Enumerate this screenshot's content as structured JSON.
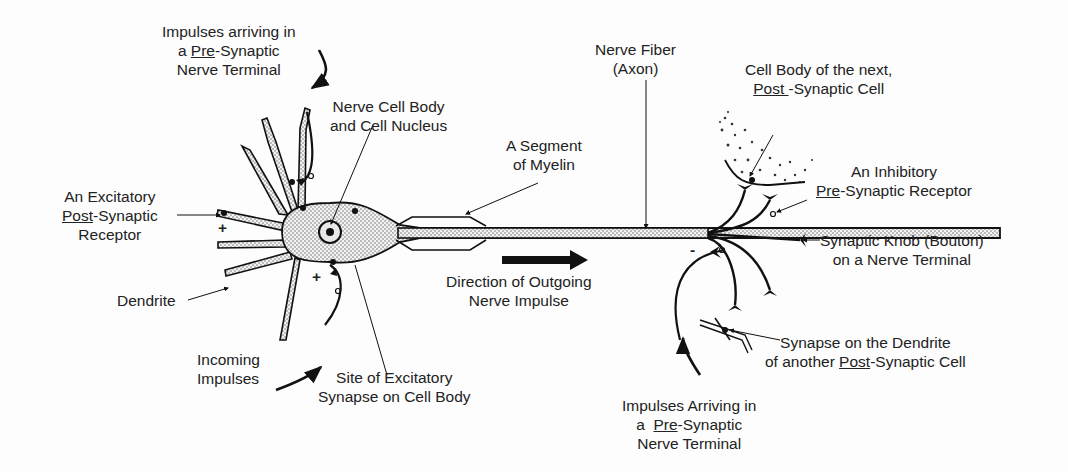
{
  "diagram": {
    "colors": {
      "ink": "#111111",
      "background": "#fdfdfd",
      "stipple": "#9a9a9a"
    },
    "labels": {
      "pre_synaptic_top": {
        "line1": "Impulses arriving in",
        "line2_a": "a ",
        "line2_u": "Pre",
        "line2_b": "-Synaptic",
        "line3": "Nerve Terminal"
      },
      "cell_body": {
        "line1": "Nerve Cell Body",
        "line2": "and Cell Nucleus"
      },
      "excitatory_receptor": {
        "line1": "An Excitatory",
        "line2_u": "Post",
        "line2_b": "-Synaptic",
        "line3": "Receptor"
      },
      "dendrite": {
        "text": "Dendrite"
      },
      "incoming": {
        "line1": "Incoming",
        "line2": "Impulses"
      },
      "site_excitatory": {
        "line1": "Site of Excitatory",
        "line2": "Synapse on Cell Body"
      },
      "myelin": {
        "line1": "A Segment",
        "line2": "of Myelin"
      },
      "direction": {
        "line1": "Direction of Outgoing",
        "line2": "Nerve Impulse"
      },
      "nerve_fiber": {
        "line1": "Nerve Fiber",
        "line2": "(Axon)"
      },
      "next_cell": {
        "line1": "Cell Body of the next,",
        "line2_u": "Post ",
        "line2_b": "-Synaptic Cell"
      },
      "inhibitory": {
        "line1": "An Inhibitory",
        "line2_u": "Pre",
        "line2_b": "-Synaptic Receptor"
      },
      "knob": {
        "line1": "Synaptic Knob (Bouton)",
        "line2": "on a Nerve Terminal"
      },
      "synapse_dendrite": {
        "line1": "Synapse on the Dendrite",
        "line2_a": "of another ",
        "line2_u": "Post",
        "line2_b": "-Synaptic Cell"
      },
      "pre_synaptic_bottom": {
        "line1": "Impulses Arriving in",
        "line2_a": "a  ",
        "line2_u": "Pre",
        "line2_b": "-Synaptic",
        "line3": "Nerve Terminal"
      },
      "signs": {
        "plus": "+",
        "minus": "-"
      }
    }
  }
}
